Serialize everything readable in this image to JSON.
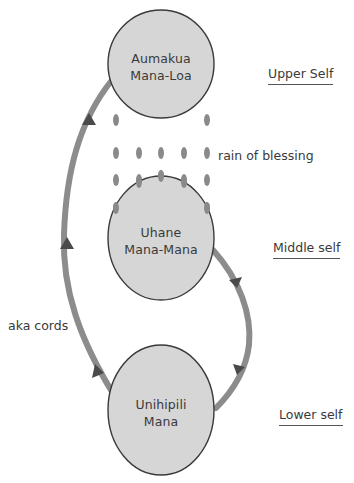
{
  "diagram": {
    "colors": {
      "ellipse_fill": "#d6d6d6",
      "ellipse_stroke": "#3a3a3a",
      "cord": "#8c8c8c",
      "arrow": "#4a4a4a",
      "rain": "#8a8a8a",
      "text": "#3a3a3a"
    },
    "nodes": [
      {
        "id": "upper",
        "line1": "Aumakua",
        "line2": "Mana-Loa",
        "level_label": "Upper Self"
      },
      {
        "id": "middle",
        "line1": "Uhane",
        "line2": "Mana-Mana",
        "level_label": "Middle self"
      },
      {
        "id": "lower",
        "line1": "Unihipili",
        "line2": "Mana",
        "level_label": "Lower self"
      }
    ],
    "rain_label": "rain of blessing",
    "cords_label": "aka cords"
  }
}
